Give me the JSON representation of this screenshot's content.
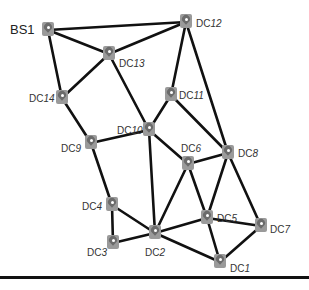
{
  "diagram": {
    "type": "network-topology",
    "nodes": [
      {
        "id": "BS1",
        "prefix": "BS",
        "num": "1",
        "x": 48,
        "y": 30,
        "lx": 10,
        "ly": 24,
        "big": true
      },
      {
        "id": "DC12",
        "prefix": "DC",
        "num": "12",
        "x": 186,
        "y": 22,
        "lx": 196,
        "ly": 18
      },
      {
        "id": "DC13",
        "prefix": "DC",
        "num": "13",
        "x": 109,
        "y": 54,
        "lx": 119,
        "ly": 58
      },
      {
        "id": "DC14",
        "prefix": "DC",
        "num": "14",
        "x": 62,
        "y": 98,
        "lx": 29,
        "ly": 93
      },
      {
        "id": "DC11",
        "prefix": "DC",
        "num": "11",
        "x": 171,
        "y": 95,
        "lx": 179,
        "ly": 90
      },
      {
        "id": "DC10",
        "prefix": "DC",
        "num": "10",
        "x": 149,
        "y": 130,
        "lx": 117,
        "ly": 125
      },
      {
        "id": "DC9",
        "prefix": "DC",
        "num": "9",
        "x": 91,
        "y": 143,
        "lx": 61,
        "ly": 143
      },
      {
        "id": "DC8",
        "prefix": "DC",
        "num": "8",
        "x": 228,
        "y": 153,
        "lx": 238,
        "ly": 148
      },
      {
        "id": "DC6",
        "prefix": "DC",
        "num": "6",
        "x": 188,
        "y": 164,
        "lx": 181,
        "ly": 143
      },
      {
        "id": "DC4",
        "prefix": "DC",
        "num": "4",
        "x": 112,
        "y": 205,
        "lx": 82,
        "ly": 201
      },
      {
        "id": "DC5",
        "prefix": "DC",
        "num": "5",
        "x": 207,
        "y": 218,
        "lx": 217,
        "ly": 213
      },
      {
        "id": "DC3",
        "prefix": "DC",
        "num": "3",
        "x": 113,
        "y": 243,
        "lx": 87,
        "ly": 247
      },
      {
        "id": "DC2",
        "prefix": "DC",
        "num": "2",
        "x": 155,
        "y": 233,
        "lx": 145,
        "ly": 247
      },
      {
        "id": "DC7",
        "prefix": "DC",
        "num": "7",
        "x": 261,
        "y": 226,
        "lx": 270,
        "ly": 224
      },
      {
        "id": "DC1",
        "prefix": "DC",
        "num": "1",
        "x": 220,
        "y": 262,
        "lx": 230,
        "ly": 263
      }
    ],
    "edges": [
      [
        "BS1",
        "DC12"
      ],
      [
        "BS1",
        "DC13"
      ],
      [
        "BS1",
        "DC14"
      ],
      [
        "DC12",
        "DC13"
      ],
      [
        "DC12",
        "DC11"
      ],
      [
        "DC12",
        "DC8"
      ],
      [
        "DC13",
        "DC14"
      ],
      [
        "DC13",
        "DC10"
      ],
      [
        "DC14",
        "DC9"
      ],
      [
        "DC11",
        "DC10"
      ],
      [
        "DC11",
        "DC8"
      ],
      [
        "DC10",
        "DC9"
      ],
      [
        "DC10",
        "DC2"
      ],
      [
        "DC10",
        "DC6"
      ],
      [
        "DC9",
        "DC4"
      ],
      [
        "DC6",
        "DC8"
      ],
      [
        "DC6",
        "DC2"
      ],
      [
        "DC6",
        "DC5"
      ],
      [
        "DC8",
        "DC5"
      ],
      [
        "DC8",
        "DC7"
      ],
      [
        "DC4",
        "DC3"
      ],
      [
        "DC4",
        "DC2"
      ],
      [
        "DC3",
        "DC2"
      ],
      [
        "DC2",
        "DC5"
      ],
      [
        "DC2",
        "DC1"
      ],
      [
        "DC5",
        "DC7"
      ],
      [
        "DC5",
        "DC1"
      ],
      [
        "DC7",
        "DC1"
      ]
    ],
    "colors": {
      "edge": "#111111",
      "marker": "#9a9a9a",
      "label": "#333333"
    }
  }
}
